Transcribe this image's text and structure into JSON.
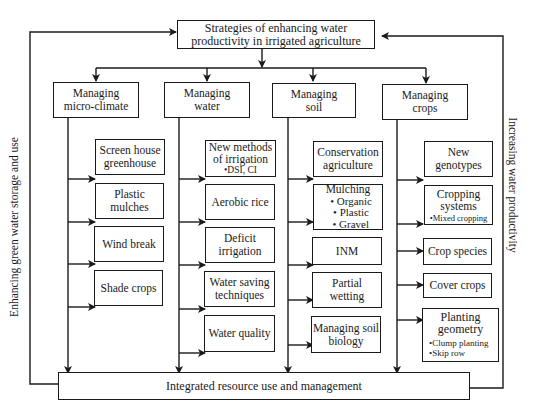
{
  "diagram": {
    "top": {
      "line1": "Strategies of enhancing water",
      "line2": "productivity in irrigated agriculture"
    },
    "bottom": {
      "label": "Integrated resource use and management"
    },
    "side_left": "Enhancing green water storage and use",
    "side_right": "Increasing water productivity",
    "categories": [
      {
        "line1": "Managing",
        "line2": "micro-climate",
        "items": [
          {
            "line1": "Screen house",
            "line2": "greenhouse"
          },
          {
            "line1": "Plastic",
            "line2": "mulches"
          },
          {
            "line1": "Wind break"
          },
          {
            "line1": "Shade crops"
          }
        ]
      },
      {
        "line1": "Managing",
        "line2": "water",
        "items": [
          {
            "line1": "New methods",
            "line2": "of irrigation",
            "sub": "•DSI, CI"
          },
          {
            "line1": "Aerobic rice"
          },
          {
            "line1": "Deficit",
            "line2": "irrigation"
          },
          {
            "line1": "Water saving",
            "line2": "techniques"
          },
          {
            "line1": "Water quality"
          }
        ]
      },
      {
        "line1": "Managing",
        "line2": "soil",
        "items": [
          {
            "line1": "Conservation",
            "line2": "agriculture"
          },
          {
            "line1": "Mulching",
            "bullets": [
              "• Organic",
              "• Plastic",
              "• Gravel"
            ]
          },
          {
            "line1": "INM"
          },
          {
            "line1": "Partial",
            "line2": "wetting"
          },
          {
            "line1": "Managing soil",
            "line2": "biology"
          }
        ]
      },
      {
        "line1": "Managing",
        "line2": "crops",
        "items": [
          {
            "line1": "New",
            "line2": "genotypes"
          },
          {
            "line1": "Cropping",
            "line2": "systems",
            "sub": "•Mixed cropping"
          },
          {
            "line1": "Crop species"
          },
          {
            "line1": "Cover crops"
          },
          {
            "line1": "Planting",
            "line2": "geometry",
            "bullets": [
              "•Clump planting",
              "•Skip row"
            ]
          }
        ]
      }
    ]
  }
}
